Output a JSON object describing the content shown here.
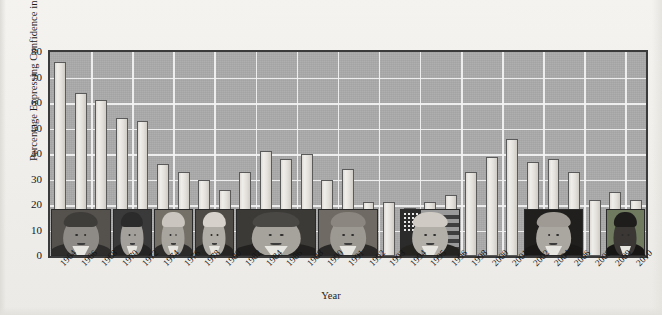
{
  "chart_data": {
    "type": "bar",
    "title": "",
    "xlabel": "Year",
    "ylabel": "Percentage Expressing Confidence in Government",
    "ylim": [
      0,
      80
    ],
    "yticks": [
      0,
      10,
      20,
      30,
      40,
      50,
      60,
      70,
      80
    ],
    "grid": true,
    "legend": null,
    "categories": [
      "1964",
      "1966",
      "1968",
      "1970",
      "1972",
      "1974",
      "1976",
      "1978",
      "1980",
      "1982",
      "1984",
      "1986",
      "1988",
      "1990",
      "1991",
      "1992",
      "1993",
      "1994",
      "1995",
      "1996",
      "1998",
      "2000",
      "2001",
      "2002",
      "2004",
      "2006",
      "2008",
      "2009",
      "2010"
    ],
    "values": [
      76,
      64,
      61,
      54,
      53,
      36,
      33,
      30,
      26,
      33,
      41,
      38,
      40,
      30,
      34,
      21,
      21,
      19,
      21,
      24,
      33,
      39,
      46,
      37,
      38,
      33,
      22,
      25,
      22
    ],
    "series": [
      {
        "name": "Percentage Expressing Confidence in Government",
        "values": [
          76,
          64,
          61,
          54,
          53,
          36,
          33,
          30,
          26,
          33,
          41,
          38,
          40,
          30,
          34,
          21,
          21,
          19,
          21,
          24,
          33,
          39,
          46,
          37,
          38,
          33,
          22,
          25,
          22
        ]
      }
    ],
    "annotations": [
      {
        "kind": "photo",
        "name": "lyndon-b-johnson-portrait",
        "span": [
          "1964",
          "1968"
        ]
      },
      {
        "kind": "photo",
        "name": "richard-nixon-portrait",
        "span": [
          "1970",
          "1972"
        ]
      },
      {
        "kind": "photo",
        "name": "gerald-ford-portrait",
        "span": [
          "1974",
          "1976"
        ]
      },
      {
        "kind": "photo",
        "name": "jimmy-carter-portrait",
        "span": [
          "1978",
          "1980"
        ]
      },
      {
        "kind": "photo",
        "name": "ronald-reagan-portrait",
        "span": [
          "1982",
          "1988"
        ]
      },
      {
        "kind": "photo",
        "name": "george-h-w-bush-portrait",
        "span": [
          "1990",
          "1992"
        ]
      },
      {
        "kind": "photo",
        "name": "bill-clinton-portrait",
        "span": [
          "1994",
          "1996"
        ]
      },
      {
        "kind": "photo",
        "name": "george-w-bush-portrait",
        "span": [
          "2002",
          "2006"
        ]
      },
      {
        "kind": "photo",
        "name": "barack-obama-portrait",
        "span": [
          "2009",
          "2010"
        ]
      }
    ]
  },
  "colors": {
    "figure_background": "#f2f1ee",
    "plot_background": "#a9a9a9",
    "gridline": "#f3f3f3",
    "bar_fill": "#e6e3de",
    "bar_edge": "#5a5a5a",
    "axis_frame": "#3b3b3b",
    "text": "#1b1b1b"
  }
}
